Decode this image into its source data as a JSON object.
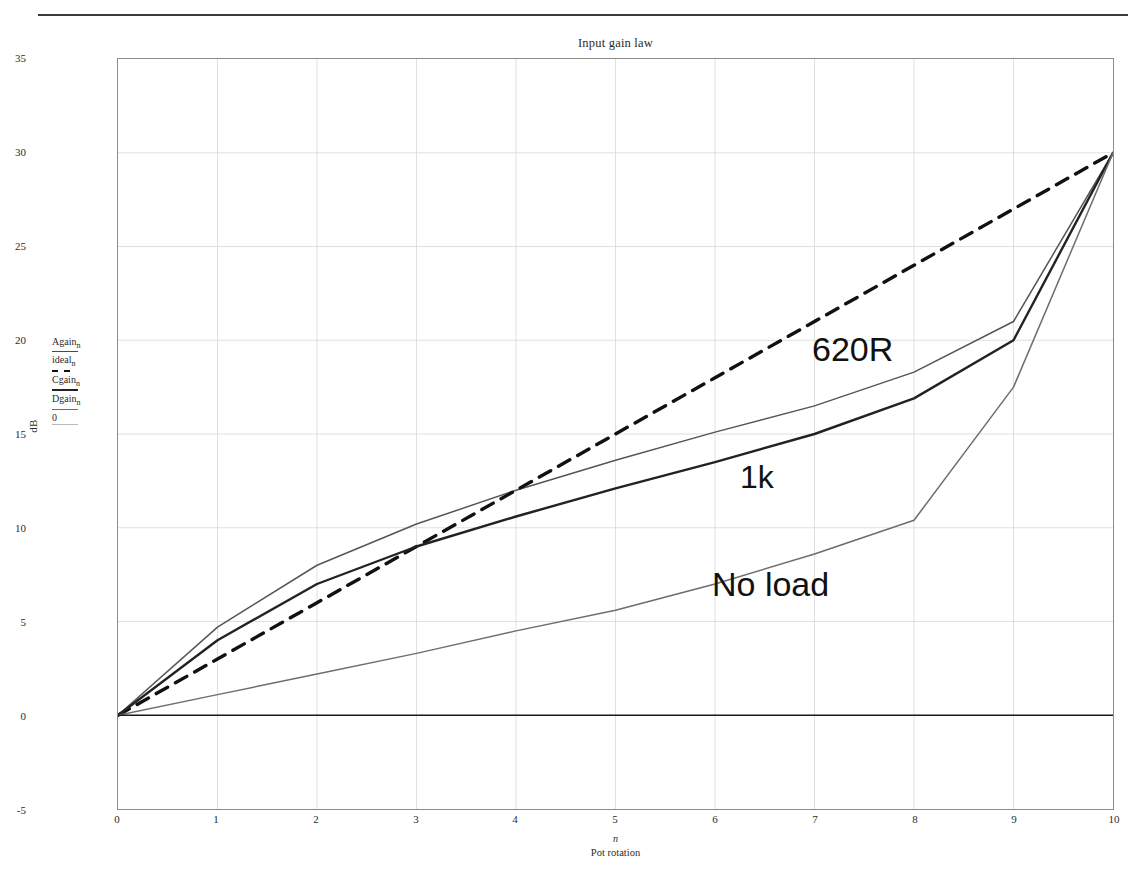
{
  "chart_data": {
    "type": "line",
    "title": "Input gain law",
    "xlabel": "n",
    "xlabel_sub": "Pot rotation",
    "ylabel": "dB",
    "xlim": [
      0,
      10
    ],
    "ylim": [
      -5,
      35
    ],
    "xticks": [
      0,
      1,
      2,
      3,
      4,
      5,
      6,
      7,
      8,
      9,
      10
    ],
    "yticks": [
      -5,
      0,
      5,
      10,
      15,
      20,
      25,
      30,
      35
    ],
    "grid": true,
    "legend_position": "left-outside",
    "x": [
      0,
      1,
      2,
      3,
      4,
      5,
      6,
      7,
      8,
      9,
      10
    ],
    "series": [
      {
        "name": "Again",
        "legend_label": "Again",
        "legend_sub": "n",
        "style": "solid-thin",
        "color": "#555555",
        "annotation": "620R",
        "values": [
          0,
          4.7,
          8.0,
          10.2,
          12.0,
          13.6,
          15.1,
          16.5,
          18.3,
          21.0,
          30.0
        ]
      },
      {
        "name": "ideal",
        "legend_label": "ideal",
        "legend_sub": "n",
        "style": "dashed",
        "color": "#111111",
        "annotation": "",
        "values": [
          0,
          3.0,
          6.0,
          9.0,
          12.0,
          15.0,
          18.0,
          21.0,
          24.0,
          27.0,
          30.0
        ]
      },
      {
        "name": "Cgain",
        "legend_label": "Cgain",
        "legend_sub": "n",
        "style": "solid-bold",
        "color": "#222222",
        "annotation": "1k",
        "values": [
          0,
          4.0,
          7.0,
          9.0,
          10.6,
          12.1,
          13.5,
          15.0,
          16.9,
          20.0,
          30.0
        ]
      },
      {
        "name": "Dgain",
        "legend_label": "Dgain",
        "legend_sub": "n",
        "style": "solid-light",
        "color": "#6d6d6d",
        "annotation": "No load",
        "values": [
          0,
          1.1,
          2.2,
          3.3,
          4.5,
          5.6,
          7.0,
          8.6,
          10.4,
          17.5,
          30.0
        ]
      },
      {
        "name": "zero",
        "legend_label": "0",
        "legend_sub": "",
        "style": "solid-faint",
        "color": "#b9b9b9",
        "annotation": "",
        "values": [
          0,
          0,
          0,
          0,
          0,
          0,
          0,
          0,
          0,
          0,
          0
        ]
      }
    ],
    "baseline": {
      "value": 0,
      "color": "#1a1a1a",
      "width": 1.6
    }
  },
  "annotations": {
    "a620r": "620R",
    "a1k": "1k",
    "anoload": "No load"
  }
}
